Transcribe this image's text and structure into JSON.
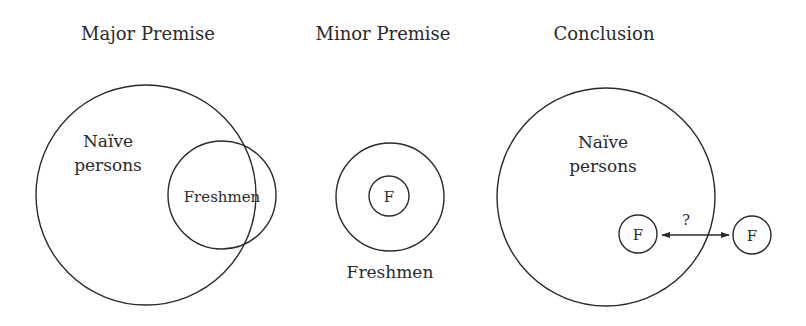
{
  "panels": [
    {
      "title": "Major Premise",
      "outer_label_line1": "Naïve",
      "outer_label_line2": "persons",
      "inner_label": "Freshmen"
    },
    {
      "title": "Minor Premise",
      "inner_label": "F",
      "bottom_label": "Freshmen"
    },
    {
      "title": "Conclusion",
      "outer_label_line1": "Naïve",
      "outer_label_line2": "persons",
      "inside_marker": "F",
      "outside_marker": "F",
      "arrow_label": "?"
    }
  ],
  "colors": {
    "stroke": "#2a2a2a",
    "background": "#ffffff"
  }
}
